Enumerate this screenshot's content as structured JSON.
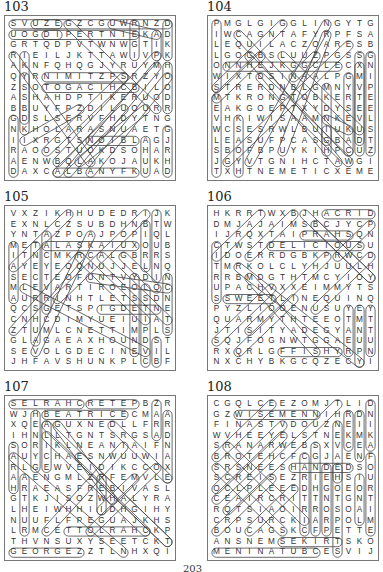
{
  "page_number": "203",
  "puzzles": [
    {
      "number": "103",
      "grid": [
        "SVUZEGZCGUWRNZD",
        "UOGDIPERTNIEKAD",
        "GRTQDPVTWNWGTIK",
        "RIEILJKTTAWIVPK",
        "AKNFQHQGJYRUYMH",
        "QYRNIMITZPSRZYO",
        "ZSOTOGACIHCBILO",
        "ASHAHDPTIKERUOD",
        "BBUYFPZDILUOURR",
        "GDSLSERVFHDYTNG",
        "NKHOLARASNUAETG",
        "IIXRGTSNOIBLAGJ",
        "RAOOSTUOKDSOHAR",
        "AENWBQLAKOJAUKH",
        "DAXCALBANYFKUAD"
      ],
      "circled_words_segments": [
        [
          0,
          0,
          4,
          0
        ],
        [
          0,
          1,
          4,
          1
        ],
        [
          1,
          3,
          1,
          10
        ],
        [
          1,
          5,
          1,
          9
        ],
        [
          0,
          9,
          0,
          14
        ],
        [
          2,
          0,
          14,
          0
        ],
        [
          14,
          0,
          14,
          3
        ],
        [
          14,
          4,
          14,
          8
        ],
        [
          3,
          1,
          11,
          1
        ],
        [
          3,
          5,
          10,
          5
        ],
        [
          3,
          6,
          11,
          6
        ],
        [
          5,
          0,
          13,
          8
        ],
        [
          5,
          14,
          13,
          4
        ],
        [
          4,
          14,
          10,
          8
        ],
        [
          11,
          0,
          11,
          3
        ],
        [
          12,
          11,
          12,
          14
        ],
        [
          13,
          1,
          13,
          3
        ],
        [
          14,
          10,
          14,
          14
        ],
        [
          4,
          14,
          11,
          14
        ],
        [
          7,
          11,
          11,
          11
        ],
        [
          1,
          11,
          6,
          8
        ],
        [
          0,
          3,
          7,
          13
        ],
        [
          3,
          12,
          10,
          5
        ],
        [
          6,
          13,
          12,
          8
        ],
        [
          13,
          3,
          4,
          13
        ],
        [
          14,
          5,
          7,
          14
        ],
        [
          9,
          0,
          13,
          1
        ]
      ]
    },
    {
      "number": "104",
      "grid": [
        "PMGLGIGGLINGYTG",
        "IWCAGNTAFYRPFSA",
        "LEQUILACZOARESB",
        "LGOGBSLUUZPGSSG",
        "ONNHEJKGGCLECXN",
        "WIXTDSINAALPGMI",
        "STRERDNBLGMNYVP",
        "MTKRONGTOBKERTE",
        "EAKGOEPTXYDYSEE",
        "VHKIWISAAMNKEVL",
        "WCSESRWLBUIUKUS",
        "LEASUFPCASGBADT",
        "SBOFBPUYKIHPCUZ",
        "JGYVTGNIHCTAWGI",
        "TXHTNEMETICXEME"
      ],
      "circled_words_segments": [
        [
          0,
          0,
          0,
          6
        ],
        [
          1,
          4,
          11,
          4
        ],
        [
          2,
          9,
          2,
          14
        ],
        [
          0,
          14,
          0,
          7
        ],
        [
          4,
          3,
          0,
          7
        ],
        [
          13,
          4,
          13,
          11
        ],
        [
          10,
          6,
          10,
          11
        ],
        [
          10,
          9,
          12,
          10
        ],
        [
          10,
          10,
          10,
          12
        ],
        [
          13,
          3,
          13,
          12
        ],
        [
          14,
          3,
          14,
          12
        ],
        [
          12,
          12,
          12,
          5
        ],
        [
          3,
          3,
          11,
          13
        ],
        [
          6,
          12,
          10,
          1
        ],
        [
          4,
          5,
          12,
          13
        ],
        [
          0,
          6,
          6,
          0
        ],
        [
          2,
          1,
          12,
          12
        ],
        [
          6,
          3,
          13,
          10
        ],
        [
          10,
          0,
          3,
          13
        ],
        [
          12,
          2,
          1,
          13
        ],
        [
          7,
          5,
          9,
          3
        ]
      ]
    },
    {
      "number": "105",
      "grid": [
        "VXZIKHHUDEDRIJK",
        "EXNLCZSUBDHNBTW",
        "YNTAZPOAJPOPIQL",
        "METALASKAIUXOUB",
        "ITNCMKRCALGBRRS",
        "AYEYEOQNUJJELNQ",
        "SECTEOFUNTVYDIN",
        "MLEVARTIROEOLQC",
        "AURRINHTLETSSDN",
        "QCSGETSPIGDETNE",
        "CNHCDIMYUEIUIAT",
        "ZTUMLCNETTIMPLS",
        "GLAGAEAXHOUNDST",
        "SEVOLGDECINEVIL",
        "JHFAVSHUNKPLCBF"
      ],
      "circled_words_segments": [
        [
          3,
          2,
          3,
          9
        ],
        [
          0,
          3,
          0,
          8
        ],
        [
          2,
          3,
          2,
          12
        ],
        [
          3,
          3,
          11,
          3
        ],
        [
          7,
          6,
          14,
          7
        ],
        [
          8,
          9,
          13,
          9
        ],
        [
          12,
          7,
          12,
          14
        ],
        [
          13,
          12,
          13,
          14
        ],
        [
          14,
          6,
          14,
          11
        ],
        [
          11,
          6,
          11,
          13
        ],
        [
          12,
          1,
          12,
          5
        ],
        [
          13,
          0,
          13,
          6
        ],
        [
          5,
          0,
          0,
          5
        ],
        [
          12,
          0,
          4,
          8
        ],
        [
          7,
          2,
          2,
          13
        ],
        [
          8,
          4,
          14,
          10
        ],
        [
          10,
          4,
          13,
          7
        ],
        [
          1,
          7,
          12,
          13
        ],
        [
          0,
          11,
          6,
          4
        ],
        [
          6,
          4,
          12,
          10
        ]
      ]
    },
    {
      "number": "106",
      "grid": [
        "HKRRTWXBJHACRID",
        "DMJAJAIMSBCJYCP",
        "IJRQXTAIPRAHSQN",
        "CTWSTDELICIOUSU",
        "IDOERRDGBKPRWCD",
        "TMRKOLCLYHJUULH",
        "RRBMDGTHTMCYIOY",
        "UPACHVXXEIMMYTS",
        "SSWEETLINEQUINQ",
        "PYZLIOOENUSUYEY",
        "QUARMYTHTEEOTMT",
        "JTISITYADEGYANT",
        "SQJFOGNWTGGAEUU",
        "RXQRLGFFISHYRPN",
        "NXCHYBKGCQZECYI"
      ],
      "circled_words_segments": [
        [
          10,
          0,
          14,
          0
        ],
        [
          8,
          2,
          12,
          2
        ],
        [
          5,
          3,
          13,
          3
        ],
        [
          0,
          3,
          0,
          8
        ],
        [
          1,
          8,
          5,
          8
        ],
        [
          6,
          13,
          11,
          13
        ],
        [
          12,
          9,
          12,
          13
        ],
        [
          13,
          9,
          13,
          14
        ],
        [
          14,
          9,
          14,
          13
        ],
        [
          11,
          4,
          14,
          1
        ],
        [
          14,
          4,
          9,
          9
        ],
        [
          7,
          0,
          3,
          4
        ],
        [
          4,
          0,
          0,
          4
        ],
        [
          8,
          0,
          14,
          6
        ],
        [
          2,
          5,
          13,
          14
        ],
        [
          3,
          6,
          9,
          13
        ],
        [
          3,
          11,
          10,
          4
        ],
        [
          2,
          13,
          7,
          8
        ],
        [
          0,
          12,
          5,
          7
        ],
        [
          9,
          1,
          14,
          6
        ]
      ]
    },
    {
      "number": "107",
      "grid": [
        "SELRAHCRETEPBZR",
        "WJHBEATRICECMAA",
        "XQEAGUXNEDLLFRR",
        "IHNLLTGNTSRGSAD",
        "SORIKLNEANIAIFN",
        "AUYCHAESNWUUWIA",
        "RLGEWVEIDIKCCOX",
        "AAENGMLZRFEMVLE",
        "HRAEASFREBIVASL",
        "GTKJISOZWHALYRA",
        "LHEIWHHIIDHGIHY",
        "NUUFLFPEGUAJKHS",
        "LRMCETTOLRAHCKP",
        "THVNSUXYSEETCKT",
        "GEORGEZZTLNHXQI"
      ],
      "circled_words_segments": [
        [
          0,
          0,
          6,
          0
        ],
        [
          7,
          0,
          11,
          0
        ],
        [
          3,
          1,
          10,
          1
        ],
        [
          13,
          0,
          13,
          3
        ],
        [
          14,
          1,
          14,
          7
        ],
        [
          2,
          1,
          2,
          6
        ],
        [
          0,
          4,
          0,
          8
        ],
        [
          1,
          7,
          1,
          12
        ],
        [
          3,
          2,
          3,
          6
        ],
        [
          5,
          12,
          12,
          12
        ],
        [
          0,
          14,
          6,
          14
        ],
        [
          8,
          7,
          8,
          10
        ],
        [
          3,
          2,
          14,
          13
        ],
        [
          3,
          3,
          12,
          12
        ],
        [
          9,
          2,
          14,
          7
        ],
        [
          0,
          5,
          10,
          14
        ],
        [
          6,
          5,
          14,
          13
        ],
        [
          4,
          2,
          9,
          9
        ],
        [
          10,
          4,
          3,
          12
        ],
        [
          13,
          6,
          7,
          12
        ],
        [
          11,
          7,
          8,
          10
        ]
      ]
    },
    {
      "number": "108",
      "grid": [
        "CGQLCEEZOMJTLID",
        "GZWISEMENNIHRDN",
        "FINASTVDOUZNEII",
        "WVHEEYELSTNEKMK",
        "SRANARWEBSXVCEA",
        "BROTEHCFCGJAENF",
        "SRSNEESHANDEDSO",
        "SCREISEZRIEHSIU",
        "OCLPLEEEDHGOEOR",
        "CEAIRCRITTNTGNT",
        "RQTSIAOIRROSOAI",
        "CRPSURCKIARPOLM",
        "BOUCAGSKCFPETTE",
        "ANSNEMSEKIRTSKO",
        "MENINATUBCESVIJ"
      ],
      "circled_words_segments": [
        [
          2,
          1,
          9,
          1
        ],
        [
          14,
          0,
          14,
          4
        ],
        [
          12,
          1,
          12,
          4
        ],
        [
          13,
          1,
          13,
          5
        ],
        [
          11,
          2,
          11,
          7
        ],
        [
          7,
          6,
          12,
          6
        ],
        [
          9,
          4,
          9,
          12
        ],
        [
          8,
          5,
          8,
          12
        ],
        [
          10,
          6,
          10,
          12
        ],
        [
          6,
          13,
          11,
          13
        ],
        [
          0,
          14,
          9,
          14
        ],
        [
          14,
          5,
          14,
          12
        ],
        [
          13,
          7,
          13,
          11
        ],
        [
          11,
          6,
          11,
          14
        ],
        [
          5,
          0,
          0,
          5
        ],
        [
          11,
          0,
          1,
          10
        ],
        [
          6,
          2,
          0,
          8
        ],
        [
          5,
          7,
          0,
          12
        ],
        [
          7,
          8,
          3,
          12
        ],
        [
          6,
          3,
          0,
          9
        ],
        [
          1,
          4,
          8,
          11
        ],
        [
          0,
          6,
          6,
          12
        ]
      ]
    }
  ]
}
